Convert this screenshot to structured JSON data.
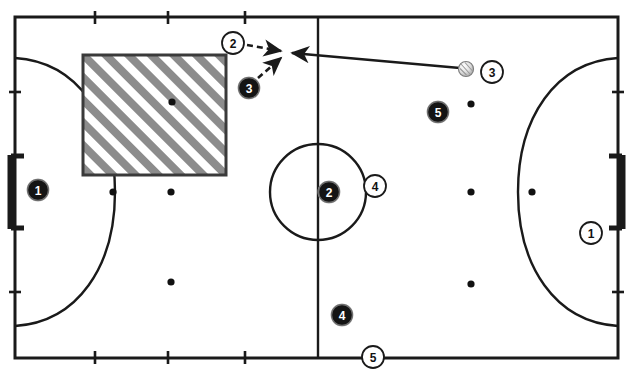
{
  "diagram": {
    "type": "sports-court-play-diagram",
    "colors": {
      "line": "#1a1a1a",
      "hatch": "#8c8c8c",
      "dark_marker_fill": "#141414",
      "light_marker_fill": "#ffffff",
      "ball_fill": "#e8e8e8",
      "background": "#ffffff"
    },
    "court": {
      "boundary": {
        "x": 15,
        "y": 17,
        "width": 603,
        "height": 341
      },
      "halfway_line_x": 318,
      "center_circle": {
        "cx": 318,
        "cy": 192,
        "r": 48
      },
      "left_goal_area_arc_label": "left-penalty-arc",
      "right_goal_area_arc_label": "right-penalty-arc",
      "top_tick_positions": [
        95,
        168,
        245
      ],
      "bottom_tick_positions": [
        95,
        168,
        245
      ],
      "left_tick_positions": [
        92,
        292
      ],
      "right_tick_positions": [
        92,
        292
      ]
    },
    "zone": {
      "name": "hatched-zone",
      "x": 83,
      "y": 55,
      "width": 143,
      "height": 120,
      "hatch_angle_deg": 45
    },
    "goals": [
      {
        "name": "goal-left",
        "side": "left",
        "x": 11,
        "y": 155,
        "height": 74
      },
      {
        "name": "goal-right",
        "side": "right",
        "x": 622,
        "y": 155,
        "height": 74
      }
    ],
    "cone_dots": [
      {
        "name": "cone-zone-center",
        "x": 172,
        "y": 102
      },
      {
        "name": "cone-left-mid-upper",
        "x": 171,
        "y": 192
      },
      {
        "name": "cone-left-lower",
        "x": 171,
        "y": 282
      },
      {
        "name": "cone-right-upper",
        "x": 471,
        "y": 104
      },
      {
        "name": "cone-right-mid",
        "x": 471,
        "y": 192
      },
      {
        "name": "cone-right-lower",
        "x": 471,
        "y": 284
      },
      {
        "name": "cone-left-arc",
        "x": 113,
        "y": 192
      },
      {
        "name": "cone-right-arc",
        "x": 532,
        "y": 192
      }
    ],
    "players": [
      {
        "id": "p-dark-1",
        "label": "1",
        "style": "dark",
        "x": 38,
        "y": 190,
        "r": 11
      },
      {
        "id": "p-dark-3",
        "label": "3",
        "style": "dark",
        "x": 249,
        "y": 88,
        "r": 11
      },
      {
        "id": "p-dark-5",
        "label": "5",
        "style": "dark",
        "x": 438,
        "y": 112,
        "r": 11
      },
      {
        "id": "p-dark-2",
        "label": "2",
        "style": "dark",
        "x": 329,
        "y": 192,
        "r": 11
      },
      {
        "id": "p-dark-4",
        "label": "4",
        "style": "dark",
        "x": 342,
        "y": 315,
        "r": 11
      },
      {
        "id": "p-light-2",
        "label": "2",
        "style": "light",
        "x": 233,
        "y": 43,
        "r": 11
      },
      {
        "id": "p-light-3",
        "label": "3",
        "style": "light",
        "x": 492,
        "y": 72,
        "r": 11
      },
      {
        "id": "p-light-4",
        "label": "4",
        "style": "light",
        "x": 375,
        "y": 186,
        "r": 11
      },
      {
        "id": "p-light-1",
        "label": "1",
        "style": "light",
        "x": 591,
        "y": 233,
        "r": 11
      },
      {
        "id": "p-light-5",
        "label": "5",
        "style": "light",
        "x": 373,
        "y": 357,
        "r": 11
      }
    ],
    "ball": {
      "name": "ball",
      "x": 466,
      "y": 69,
      "r": 7
    },
    "movements": [
      {
        "name": "pass-arrow-ball-to-target",
        "kind": "solid",
        "description": "pass from ball toward contest point",
        "from": {
          "x": 460,
          "y": 68
        },
        "to": {
          "x": 292,
          "y": 53
        }
      },
      {
        "name": "run-arrow-player-light-2",
        "kind": "dashed",
        "description": "light 2 moves right to contest point",
        "from": {
          "x": 247,
          "y": 45
        },
        "to": {
          "x": 283,
          "y": 52
        }
      },
      {
        "name": "run-arrow-player-dark-3",
        "kind": "dashed",
        "description": "dark 3 moves up-right to contest point",
        "from": {
          "x": 258,
          "y": 78
        },
        "to": {
          "x": 283,
          "y": 57
        }
      }
    ]
  }
}
